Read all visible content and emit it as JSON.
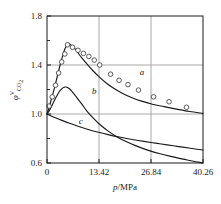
{
  "chart_data": {
    "type": "line",
    "title": "",
    "xlabel": "p/MPa",
    "ylabel_base": "φ",
    "ylabel_sup": "V",
    "ylabel_sub": "CO",
    "ylabel_sub2": "2",
    "ylabel_plain": "φV_CO2",
    "xlim": [
      0,
      40.26
    ],
    "ylim": [
      0.6,
      1.8
    ],
    "grid": true,
    "grid_style": "major gridlines at x = 13.42, 26.84 and y = 1.0, 1.4",
    "legend_position": "inline curve labels",
    "xticks": [
      0,
      13.42,
      26.84,
      40.26
    ],
    "xtick_labels": [
      "0",
      "13.42",
      "26.84",
      "40.26"
    ],
    "yticks": [
      0.6,
      1.0,
      1.4,
      1.8
    ],
    "ytick_labels": [
      "0.6",
      "1.0",
      "1.4",
      "1.8"
    ],
    "yticks_minor": [
      0.8,
      1.2,
      1.6
    ],
    "series": [
      {
        "name": "a",
        "label": "a",
        "label_x": 24.5,
        "label_y": 1.32,
        "style": "solid line with open-circle markers",
        "x": [
          0,
          0.6,
          1.2,
          1.9,
          2.6,
          3.3,
          4.0,
          4.6,
          5.2,
          5.8,
          6.5,
          7.3,
          8.2,
          9.2,
          10.4,
          11.8,
          13.4,
          15.2,
          17.2,
          19.4,
          21.8,
          24.4,
          27.2,
          30.2,
          33.4,
          36.8,
          40.26
        ],
        "y": [
          1.0,
          1.06,
          1.13,
          1.21,
          1.3,
          1.39,
          1.47,
          1.53,
          1.56,
          1.57,
          1.555,
          1.53,
          1.49,
          1.45,
          1.405,
          1.355,
          1.305,
          1.255,
          1.21,
          1.17,
          1.135,
          1.105,
          1.08,
          1.06,
          1.04,
          1.02,
          1.005
        ]
      },
      {
        "name": "b",
        "label": "b",
        "label_x": 12.2,
        "label_y": 1.165,
        "style": "solid line, no markers",
        "x": [
          0,
          0.8,
          1.6,
          2.4,
          3.1,
          3.8,
          4.4,
          4.9,
          5.4,
          6.0,
          6.8,
          7.8,
          9.0,
          10.4,
          12.0,
          13.8,
          15.8,
          18.0,
          20.4,
          23.0,
          26.0,
          29.2,
          32.6,
          36.2,
          40.26
        ],
        "y": [
          1.0,
          1.04,
          1.09,
          1.14,
          1.18,
          1.205,
          1.218,
          1.22,
          1.215,
          1.2,
          1.17,
          1.13,
          1.08,
          1.02,
          0.965,
          0.91,
          0.86,
          0.815,
          0.775,
          0.74,
          0.705,
          0.675,
          0.65,
          0.625,
          0.6
        ]
      },
      {
        "name": "c",
        "label": "c",
        "label_x": 8.7,
        "label_y": 0.915,
        "style": "solid line, no markers, monotonic decay",
        "x": [
          0,
          2,
          4,
          6,
          8,
          10,
          13,
          16,
          19,
          22,
          25,
          28,
          31,
          34,
          37,
          40.26
        ],
        "y": [
          1.0,
          0.972,
          0.946,
          0.922,
          0.9,
          0.88,
          0.853,
          0.83,
          0.81,
          0.792,
          0.776,
          0.762,
          0.748,
          0.734,
          0.72,
          0.706
        ]
      }
    ],
    "markers": {
      "series": "a",
      "marker_shape": "open circle",
      "x": [
        0.55,
        1.35,
        2.2,
        3.0,
        3.8,
        4.6,
        5.3,
        6.6,
        8.0,
        9.4,
        10.8,
        12.2,
        13.6,
        16.4,
        18.6,
        20.9,
        23.6,
        27.5,
        31.5,
        36.0
      ],
      "y": [
        1.065,
        1.14,
        1.235,
        1.335,
        1.425,
        1.49,
        1.565,
        1.545,
        1.52,
        1.495,
        1.47,
        1.44,
        1.4,
        1.325,
        1.275,
        1.24,
        1.195,
        1.14,
        1.1,
        1.055
      ]
    }
  },
  "colors": {
    "line": "#1a1a1a",
    "grid": "#a8a8a8",
    "axis": "#1a1a1a",
    "background": "#ffffff",
    "marker_stroke": "#4a4a4a"
  }
}
